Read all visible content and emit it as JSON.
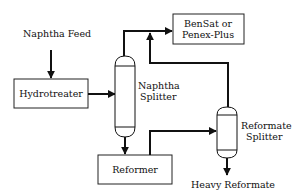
{
  "diagram": {
    "title": "",
    "nodes": {
      "naphtha_feed": {
        "label": "Naphtha Feed"
      },
      "hydrotreater": {
        "label": "Hydrotreater"
      },
      "naphtha_splitter": {
        "label_line1": "Naphtha",
        "label_line2": "Splitter"
      },
      "bensat": {
        "label_line1": "BenSat or",
        "label_line2": "Penex-Plus"
      },
      "reformer": {
        "label": "Reformer"
      },
      "reformate_splitter": {
        "label_line1": "Reformate",
        "label_line2": "Splitter"
      },
      "heavy_reformate": {
        "label": "Heavy Reformate"
      }
    },
    "edges": [
      {
        "from": "naphtha_feed",
        "to": "hydrotreater"
      },
      {
        "from": "hydrotreater",
        "to": "naphtha_splitter"
      },
      {
        "from": "naphtha_splitter",
        "to": "bensat",
        "note": "overhead"
      },
      {
        "from": "naphtha_splitter",
        "to": "reformer",
        "note": "bottoms"
      },
      {
        "from": "reformer",
        "to": "reformate_splitter"
      },
      {
        "from": "reformate_splitter",
        "to": "bensat",
        "note": "overhead joins line"
      },
      {
        "from": "reformate_splitter",
        "to": "heavy_reformate",
        "note": "bottoms"
      }
    ],
    "colors": {
      "line": "#111111",
      "background": "#ffffff"
    }
  }
}
